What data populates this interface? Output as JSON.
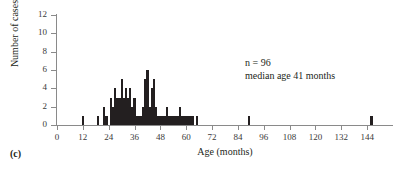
{
  "panel": {
    "label": "(c)"
  },
  "annotation": {
    "line1": "n = 96",
    "line2": "median age 41 months"
  },
  "chart_data": {
    "type": "bar",
    "title": "",
    "subtitle": "",
    "xlabel": "Age (months)",
    "ylabel": "Number of cases",
    "xlim": [
      0,
      156
    ],
    "ylim": [
      0,
      12
    ],
    "xticks": [
      0,
      12,
      24,
      36,
      48,
      60,
      72,
      84,
      96,
      108,
      120,
      132,
      144
    ],
    "yticks": [
      0,
      2,
      4,
      6,
      8,
      10,
      12
    ],
    "xtick_labels": [
      "0",
      "12",
      "24",
      "36",
      "48",
      "60",
      "72",
      "84",
      "96",
      "108",
      "120",
      "132",
      "144"
    ],
    "ytick_labels": [
      "0",
      "2",
      "4",
      "6",
      "8",
      "10",
      "12"
    ],
    "grid": false,
    "legend": false,
    "bar_color": "#231f20",
    "axis_color": "#8a8a8a",
    "bin_width_months": 1,
    "annotations": [
      "n = 96",
      "median age 41 months"
    ],
    "x": [
      12,
      19,
      22,
      23,
      25,
      26,
      27,
      28,
      29,
      30,
      31,
      32,
      33,
      34,
      35,
      36,
      37,
      38,
      39,
      40,
      41,
      42,
      43,
      44,
      45,
      46,
      47,
      48,
      49,
      50,
      51,
      52,
      53,
      54,
      55,
      56,
      57,
      58,
      59,
      60,
      61,
      62,
      63,
      65,
      89,
      146
    ],
    "values": [
      1,
      1,
      2,
      1,
      3,
      2,
      4,
      3,
      3,
      5,
      3,
      4,
      3,
      4,
      2,
      3,
      1,
      1,
      1,
      2,
      5,
      6,
      2,
      4,
      5,
      2,
      1,
      1,
      1,
      1,
      2,
      1,
      1,
      1,
      1,
      1,
      2,
      1,
      1,
      1,
      1,
      1,
      1,
      1,
      1,
      1
    ],
    "categories": [
      "12",
      "19",
      "22",
      "23",
      "25",
      "26",
      "27",
      "28",
      "29",
      "30",
      "31",
      "32",
      "33",
      "34",
      "35",
      "36",
      "37",
      "38",
      "39",
      "40",
      "41",
      "42",
      "43",
      "44",
      "45",
      "46",
      "47",
      "48",
      "49",
      "50",
      "51",
      "52",
      "53",
      "54",
      "55",
      "56",
      "57",
      "58",
      "59",
      "60",
      "61",
      "62",
      "63",
      "65",
      "89",
      "146"
    ]
  }
}
